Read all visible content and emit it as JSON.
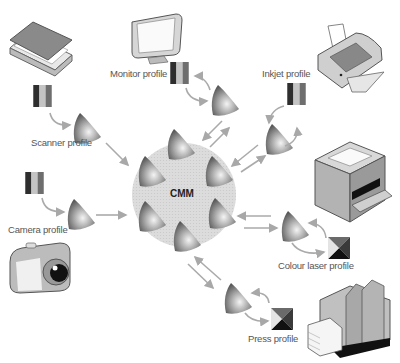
{
  "diagram": {
    "center": {
      "label": "CMM"
    },
    "devices": [
      {
        "id": "scanner",
        "label": "Scanner profile",
        "swatch": "rgb-bars",
        "direction": "input"
      },
      {
        "id": "camera",
        "label": "Camera profile",
        "swatch": "rgb-bars",
        "direction": "input"
      },
      {
        "id": "monitor",
        "label": "Monitor profile",
        "swatch": "rgb-bars",
        "direction": "bidirectional"
      },
      {
        "id": "inkjet",
        "label": "Inkjet profile",
        "swatch": "rgb-bars",
        "direction": "bidirectional"
      },
      {
        "id": "colour-laser",
        "label": "Colour laser  profile",
        "swatch": "cmyk-square",
        "direction": "bidirectional"
      },
      {
        "id": "press",
        "label": "Press profile",
        "swatch": "cmyk-square",
        "direction": "bidirectional"
      }
    ],
    "colors": {
      "arrow": "#aaaaaa",
      "cmm_disc": "#d6d6d6",
      "gamut_dark": "#555555",
      "gamut_light": "#f2f2f2"
    }
  }
}
